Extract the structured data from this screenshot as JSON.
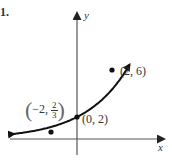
{
  "problem_number": "1.",
  "chart_data": {
    "type": "line",
    "title": "",
    "xlabel": "x",
    "ylabel": "y",
    "function": "y = 2·(3/2)^x (exponential growth, passing through listed points)",
    "points": [
      {
        "x": -2,
        "y": 0.6667,
        "label_whole": "−2,",
        "label_num": "2",
        "label_den": "3"
      },
      {
        "x": 0,
        "y": 2,
        "label": "(0, 2)"
      },
      {
        "x": 2,
        "y": 6,
        "label": "(2, 6)"
      }
    ],
    "grid": false,
    "arrows_both_ends": true,
    "axis_arrows": true
  },
  "colors": {
    "curve": "#111111",
    "axes": "#555555",
    "text": "#333333"
  }
}
